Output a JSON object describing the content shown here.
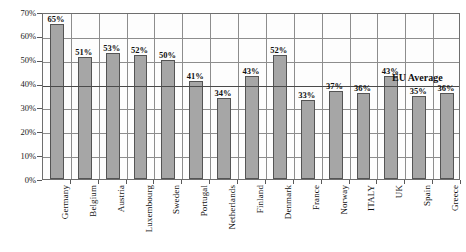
{
  "chart_data": {
    "type": "bar",
    "title": "",
    "subtitle": "",
    "xlabel": "",
    "ylabel": "",
    "ylim": [
      0,
      70
    ],
    "ytick_labels": [
      "0%",
      "10%",
      "20%",
      "30%",
      "40%",
      "50%",
      "60%",
      "70%"
    ],
    "ytick_values": [
      0,
      10,
      20,
      30,
      40,
      50,
      60,
      70
    ],
    "grid": true,
    "legend": "none",
    "categories": [
      "Germany",
      "Belgium",
      "Austria",
      "Luxembourg",
      "Sweden",
      "Portugal",
      "Netherlands",
      "Finland",
      "Denmark",
      "France",
      "Norway",
      "ITALY",
      "UK",
      "Spain",
      "Greece"
    ],
    "values": [
      65,
      51,
      53,
      52,
      50,
      41,
      34,
      43,
      52,
      33,
      37,
      36,
      43,
      35,
      36
    ],
    "data_labels": [
      "65%",
      "51%",
      "53%",
      "52%",
      "50%",
      "41%",
      "34%",
      "43%",
      "52%",
      "33%",
      "37%",
      "36%",
      "43%",
      "35%",
      "36%"
    ],
    "annotations": [
      {
        "name": "eu-average",
        "label": "EU Average",
        "value": 40,
        "type": "horizontal-reference-line"
      }
    ],
    "colors": {
      "bar_fill": "#a6a6a6",
      "bar_border": "#545454",
      "grid": "#8d8d8d",
      "axis": "#6e6e6e",
      "reference_line": "#4a4a4a",
      "text": "#111111",
      "plot_background": "#fdfdfd",
      "page_background": "#ffffff"
    }
  }
}
